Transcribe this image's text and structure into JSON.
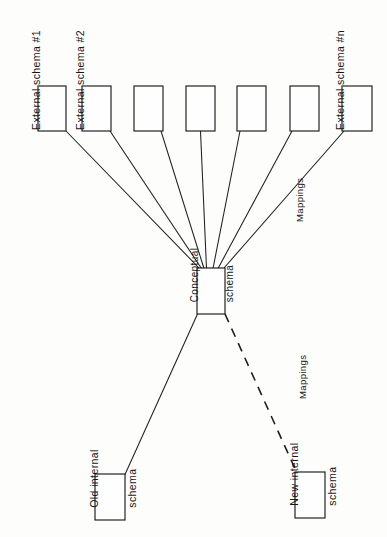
{
  "figure": {
    "kind": "three-level-architecture-diagram",
    "background_color": "#fdfdfc",
    "line_color": "#1f1f1f",
    "box_fill": "#fefefe",
    "orientation": "rotated-90-ccw-labels"
  },
  "labels": {
    "external_schema_1": "External schema #1",
    "external_schema_2": "External schema #2",
    "external_schema_n": "External schema #n",
    "mappings_upper": "Mappings",
    "mappings_lower": "Mappings",
    "conceptual_schema_line1": "Conceptual",
    "conceptual_schema_line2": "schema",
    "old_internal_line1": "Old internal",
    "old_internal_line2": "schema",
    "new_internal_line1": "New internal",
    "new_internal_line2": "schema"
  },
  "external_boxes": [
    {
      "id": "external-schema-1",
      "x": 38,
      "y": 86,
      "w": 28,
      "h": 45
    },
    {
      "id": "external-schema-2",
      "x": 82,
      "y": 86,
      "w": 29,
      "h": 45
    },
    {
      "id": "external-schema-3",
      "x": 134,
      "y": 86,
      "w": 29,
      "h": 45
    },
    {
      "id": "external-schema-4",
      "x": 186,
      "y": 86,
      "w": 29,
      "h": 45
    },
    {
      "id": "external-schema-5",
      "x": 237,
      "y": 86,
      "w": 29,
      "h": 45
    },
    {
      "id": "external-schema-6",
      "x": 290,
      "y": 86,
      "w": 29,
      "h": 45
    },
    {
      "id": "external-schema-n",
      "x": 342,
      "y": 86,
      "w": 30,
      "h": 45
    }
  ],
  "conceptual_box": {
    "id": "conceptual-schema",
    "x": 197,
    "y": 268,
    "w": 28,
    "h": 46
  },
  "internal_boxes": [
    {
      "id": "old-internal-schema",
      "x": 95,
      "y": 474,
      "w": 30,
      "h": 46
    },
    {
      "id": "new-internal-schema",
      "x": 295,
      "y": 472,
      "w": 30,
      "h": 46
    }
  ],
  "connectors": [
    {
      "from": "conceptual-schema",
      "to": "external-schema-1",
      "style": "solid"
    },
    {
      "from": "conceptual-schema",
      "to": "external-schema-2",
      "style": "solid"
    },
    {
      "from": "conceptual-schema",
      "to": "external-schema-3",
      "style": "solid"
    },
    {
      "from": "conceptual-schema",
      "to": "external-schema-4",
      "style": "solid"
    },
    {
      "from": "conceptual-schema",
      "to": "external-schema-5",
      "style": "solid"
    },
    {
      "from": "conceptual-schema",
      "to": "external-schema-6",
      "style": "solid"
    },
    {
      "from": "conceptual-schema",
      "to": "external-schema-n",
      "style": "solid"
    },
    {
      "from": "conceptual-schema",
      "to": "old-internal-schema",
      "style": "solid"
    },
    {
      "from": "conceptual-schema",
      "to": "new-internal-schema",
      "style": "dashed"
    }
  ]
}
